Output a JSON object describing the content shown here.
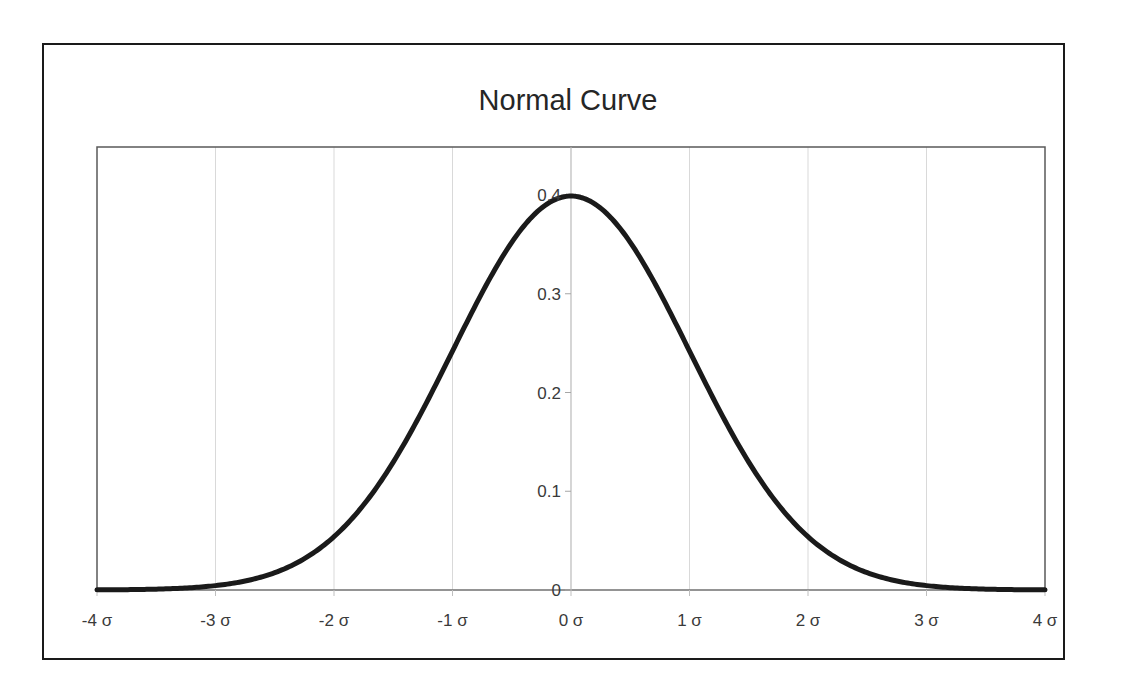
{
  "chart_data": {
    "type": "line",
    "title": "Normal Curve",
    "xlabel": "",
    "ylabel": "",
    "x_tick_labels": [
      "-4 σ",
      "-3 σ",
      "-2 σ",
      "-1 σ",
      "0 σ",
      "1 σ",
      "2 σ",
      "3 σ",
      "4 σ"
    ],
    "x_ticks": [
      -4,
      -3,
      -2,
      -1,
      0,
      1,
      2,
      3,
      4
    ],
    "y_tick_labels": [
      "0",
      "0.1",
      "0.2",
      "0.3",
      "0.4"
    ],
    "y_ticks": [
      0,
      0.1,
      0.2,
      0.3,
      0.4
    ],
    "xlim": [
      -4,
      4
    ],
    "ylim": [
      0,
      0.4
    ],
    "grid": {
      "vertical": true,
      "horizontal": false
    },
    "legend": null,
    "y_axis_position": "x=0 (center)",
    "series": [
      {
        "name": "Standard normal density",
        "x": [
          -4,
          -3.5,
          -3,
          -2.5,
          -2,
          -1.5,
          -1,
          -0.5,
          0,
          0.5,
          1,
          1.5,
          2,
          2.5,
          3,
          3.5,
          4
        ],
        "values": [
          0.0001,
          0.0009,
          0.0044,
          0.0175,
          0.054,
          0.1295,
          0.242,
          0.3521,
          0.3989,
          0.3521,
          0.242,
          0.1295,
          0.054,
          0.0175,
          0.0044,
          0.0009,
          0.0001
        ]
      }
    ],
    "colors": {
      "curve": "#1a1a1a",
      "gridline": "#d9d9d9",
      "axis": "#7f7f7f",
      "frame": "#1a1a1a",
      "text": "#3a3a3a"
    }
  }
}
